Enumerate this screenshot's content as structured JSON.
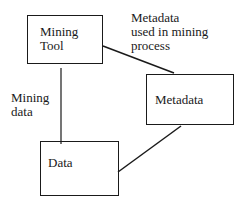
{
  "nodes": {
    "mining_tool": {
      "label": "Mining\nTool"
    },
    "metadata": {
      "label": "Metadata"
    },
    "data": {
      "label": "Data"
    }
  },
  "edges": {
    "tool_to_metadata": {
      "label": "Metadata\nused in mining\nprocess"
    },
    "tool_to_data": {
      "label": "Mining\ndata"
    },
    "metadata_to_data": {
      "label": ""
    }
  }
}
